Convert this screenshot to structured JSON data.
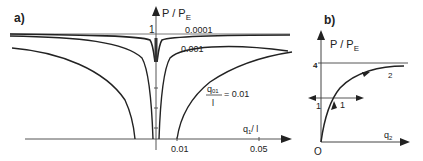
{
  "panel_a": {
    "label": "a)",
    "y_axis_label": "P / P",
    "y_axis_sub": "E",
    "y_tick_1": "1",
    "x_axis_label": "q",
    "x_axis_sub": "1",
    "x_axis_den": "/ l",
    "x_ticks": [
      "0.01",
      "0.05"
    ],
    "curve_labels": [
      "0.0001",
      "0.001"
    ],
    "param_label_num": "q",
    "param_label_sub": "01",
    "param_label_den": "l",
    "param_label_value": "= 0.01"
  },
  "panel_b": {
    "label": "b)",
    "y_axis_label": "P / P",
    "y_axis_sub": "E",
    "y_tick_4": "4",
    "x_axis_label": "q",
    "x_axis_sub": "2",
    "origin_label": "O",
    "branch_labels": [
      "1",
      "1",
      "2"
    ]
  },
  "colors": {
    "ink": "#222222",
    "axis": "#444444"
  }
}
